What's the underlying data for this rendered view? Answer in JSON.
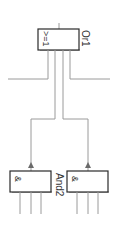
{
  "diagram": {
    "type": "logic-function-block-diagram",
    "blocks": [
      {
        "id": "or1",
        "name": "Or1",
        "symbol": ">=1",
        "kind": "OR"
      },
      {
        "id": "and2a",
        "name": "And2",
        "symbol": "&",
        "kind": "AND"
      },
      {
        "id": "and2b",
        "symbol": "&",
        "kind": "AND"
      }
    ],
    "labels": {
      "or_symbol": ">=1",
      "or_name": "Or1",
      "and_left_symbol": "&",
      "and_right_symbol": "&",
      "and_name": "And2"
    },
    "colors": {
      "wire": "#9a9a9a",
      "block_border": "#2a2a2a",
      "arrow": "#6a6a6a",
      "text": "#333333"
    }
  }
}
